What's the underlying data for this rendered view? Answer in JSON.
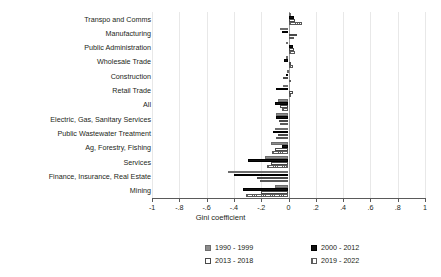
{
  "chart_data": {
    "type": "bar",
    "orientation": "horizontal",
    "title": "",
    "xlabel": "Gini coefficient",
    "ylabel": "",
    "xlim": [
      -1,
      1
    ],
    "xticks": [
      -1,
      -0.8,
      -0.6,
      -0.4,
      -0.2,
      0,
      0.2,
      0.4,
      0.6,
      0.8,
      1
    ],
    "xticklabels": [
      "-1",
      "-.8",
      "-.6",
      "-.4",
      "-.2",
      "0",
      ".2",
      ".4",
      ".6",
      ".8",
      "1"
    ],
    "grid": true,
    "legend_position": "bottom",
    "categories": [
      "Transpo and Comms",
      "Manufacturing",
      "Public Administration",
      "Wholesale Trade",
      "Construction",
      "Retail Trade",
      "All",
      "Electric, Gas, Sanitary Services",
      "Public Wastewater Treatment",
      "Ag, Forestry, Fishing",
      "Services",
      "Finance, Insurance, Real Estate",
      "Mining"
    ],
    "series": [
      {
        "name": "1990 - 1999",
        "color": "#8c8c8c",
        "values": [
          0.01,
          -0.06,
          -0.02,
          -0.02,
          -0.01,
          -0.04,
          -0.08,
          -0.09,
          -0.1,
          -0.13,
          -0.17,
          -0.44,
          -0.1
        ]
      },
      {
        "name": "2000 - 2012",
        "color": "#111111",
        "values": [
          0.04,
          -0.05,
          0.03,
          -0.03,
          -0.02,
          -0.09,
          -0.1,
          -0.09,
          -0.11,
          -0.05,
          -0.3,
          -0.4,
          -0.33
        ]
      },
      {
        "name": "2013 - 2018",
        "color": "#ffffff",
        "values": [
          0.05,
          0.06,
          0.04,
          0.02,
          -0.04,
          0.03,
          -0.06,
          -0.07,
          -0.08,
          -0.1,
          -0.13,
          -0.23,
          -0.2
        ]
      },
      {
        "name": "2019 - 2022",
        "color": "#ffffff",
        "values": [
          0.1,
          0.04,
          0.05,
          0.03,
          0.02,
          0.02,
          -0.05,
          -0.06,
          -0.09,
          -0.12,
          -0.16,
          -0.21,
          -0.31
        ]
      }
    ]
  },
  "axis": {
    "title": "Gini coefficient"
  },
  "legend": {
    "items": [
      {
        "label": "1990 - 1999"
      },
      {
        "label": "2000 - 2012"
      },
      {
        "label": "2013 - 2018"
      },
      {
        "label": "2019 - 2022"
      }
    ]
  }
}
